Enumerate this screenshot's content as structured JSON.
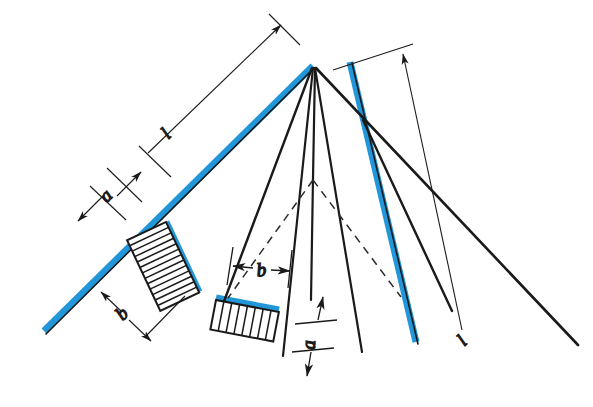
{
  "diagram": {
    "type": "technical-line-drawing",
    "background_color": "#ffffff",
    "colors": {
      "accent_blue": "#2196d8",
      "line_black": "#1a1a1a",
      "dimension_gray": "#333333",
      "hatch": "#1a1a1a"
    },
    "labels": {
      "left_length": "l",
      "left_a": "a",
      "left_b": "b",
      "center_b": "b",
      "center_a": "a",
      "right_length": "l"
    },
    "geometry": {
      "apex": {
        "x": 313,
        "y": 67
      },
      "left_rafter": {
        "x1": 313,
        "y1": 67,
        "x2": 43,
        "y2": 332
      },
      "right_apex_top": {
        "x": 350,
        "y": 60
      },
      "fan_origin": {
        "x": 313,
        "y": 180
      }
    },
    "elements": {
      "blue_members": 3,
      "hatched_blocks": 2,
      "hatch_count_large": 12,
      "hatch_count_small": 7,
      "dimension_lines": 4,
      "dashed_lines": 2
    }
  }
}
